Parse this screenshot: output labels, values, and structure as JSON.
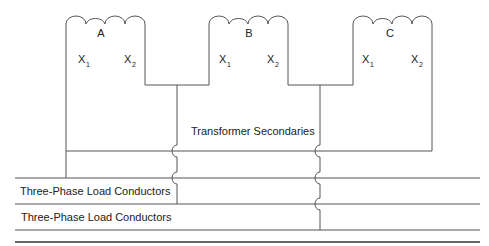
{
  "diagram": {
    "title": "Transformer Secondaries",
    "coils": [
      {
        "name": "A",
        "terminals": [
          "X",
          "X"
        ],
        "subscripts": [
          "1",
          "2"
        ]
      },
      {
        "name": "B",
        "terminals": [
          "X",
          "X"
        ],
        "subscripts": [
          "1",
          "2"
        ]
      },
      {
        "name": "C",
        "terminals": [
          "X",
          "X"
        ],
        "subscripts": [
          "1",
          "2"
        ]
      }
    ],
    "conductor_labels": [
      "Three-Phase Load Conductors",
      "Three-Phase Load Conductors"
    ],
    "colors": {
      "line": "#555555",
      "text": "#222222",
      "background": "#ffffff"
    }
  }
}
